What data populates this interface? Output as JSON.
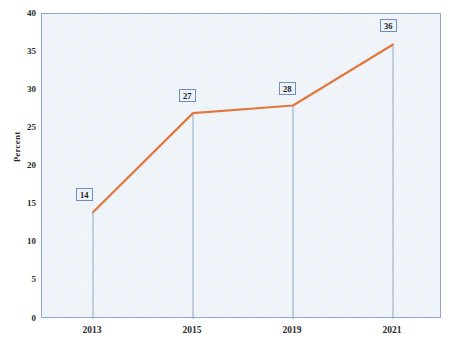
{
  "chart_data": {
    "type": "line",
    "title": "",
    "xlabel": "",
    "ylabel": "Percent",
    "categories": [
      "2013",
      "2015",
      "2019",
      "2021"
    ],
    "values": [
      14,
      27,
      28,
      36
    ],
    "point_labels": [
      "14",
      "27",
      "28",
      "36"
    ],
    "ylim": [
      0,
      40
    ],
    "y_ticks": [
      "0",
      "5",
      "10",
      "15",
      "20",
      "25",
      "30",
      "35",
      "40"
    ],
    "y_tick_values": [
      0,
      5,
      10,
      15,
      20,
      25,
      30,
      35,
      40
    ],
    "grid": false,
    "legend": "none",
    "series_color": "#e2793c",
    "plot_background": "#e8eef7",
    "plot_border_color": "#8ea7cc",
    "droplines_color": "#8ea7cc",
    "label_box_fill": "#eef2f9",
    "label_box_border": "#6f8fc0",
    "axis_text_color": "#2b2b2b"
  }
}
